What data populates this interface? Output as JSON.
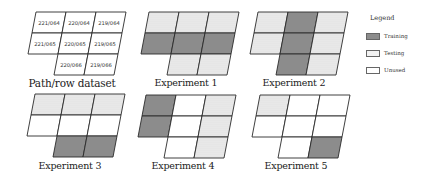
{
  "colors": {
    "training": "#8c8c8c",
    "testing": "#f0f0f0",
    "unused": "#ffffff",
    "border": "#2a2a2a"
  },
  "grid_layout": {
    "rows": 3,
    "cols": 3,
    "bottom_row_cols": [
      1,
      2
    ]
  },
  "panels": [
    {
      "caption": "Path/row dataset",
      "labels": [
        [
          "221/064",
          "220/064",
          "219/064"
        ],
        [
          "221/065",
          "220/065",
          "219/065"
        ],
        [
          null,
          "220/066",
          "219/066"
        ]
      ],
      "cells": [
        [
          "unused",
          "unused",
          "unused"
        ],
        [
          "unused",
          "unused",
          "unused"
        ],
        [
          null,
          "unused",
          "unused"
        ]
      ]
    },
    {
      "caption": "Experiment 1",
      "cells": [
        [
          "testing",
          "testing",
          "testing"
        ],
        [
          "training",
          "training",
          "training"
        ],
        [
          null,
          "testing",
          "testing"
        ]
      ]
    },
    {
      "caption": "Experiment 2",
      "cells": [
        [
          "testing",
          "training",
          "testing"
        ],
        [
          "testing",
          "training",
          "testing"
        ],
        [
          null,
          "training",
          "testing"
        ]
      ]
    },
    {
      "caption": "Experiment 3",
      "cells": [
        [
          "testing",
          "testing",
          "testing"
        ],
        [
          "unused",
          "unused",
          "unused"
        ],
        [
          null,
          "training",
          "training"
        ]
      ]
    },
    {
      "caption": "Experiment 4",
      "cells": [
        [
          "training",
          "unused",
          "testing"
        ],
        [
          "training",
          "unused",
          "testing"
        ],
        [
          null,
          "unused",
          "testing"
        ]
      ]
    },
    {
      "caption": "Experiment 5",
      "cells": [
        [
          "testing",
          "unused",
          "unused"
        ],
        [
          "unused",
          "unused",
          "unused"
        ],
        [
          null,
          "unused",
          "training"
        ]
      ]
    }
  ],
  "legend": {
    "title": "Legend",
    "items": [
      {
        "key": "training",
        "label": "Training"
      },
      {
        "key": "testing",
        "label": "Testing"
      },
      {
        "key": "unused",
        "label": "Unused"
      }
    ]
  }
}
